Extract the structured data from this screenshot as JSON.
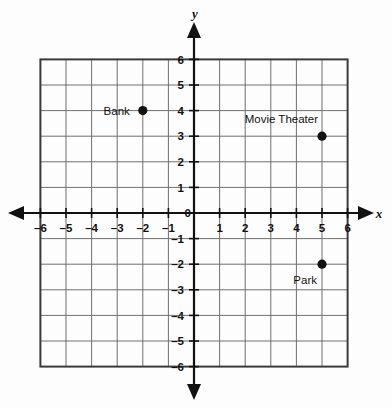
{
  "chart_data": {
    "type": "scatter",
    "title": "",
    "xlabel": "x",
    "ylabel": "y",
    "xlim": [
      -6,
      6
    ],
    "ylim": [
      -6,
      6
    ],
    "grid": true,
    "legend": "none",
    "x_ticks": [
      "-6",
      "-5",
      "-4",
      "-3",
      "-2",
      "-1",
      "1",
      "2",
      "3",
      "4",
      "5",
      "6"
    ],
    "y_ticks": [
      "6",
      "5",
      "4",
      "3",
      "2",
      "1",
      "-1",
      "-2",
      "-3",
      "-4",
      "-5",
      "-6"
    ],
    "origin_label": "0",
    "points": [
      {
        "label": "Bank",
        "x": -2,
        "y": 4,
        "label_position": "left"
      },
      {
        "label": "Movie Theater",
        "x": 5,
        "y": 3,
        "label_position": "above-left"
      },
      {
        "label": "Park",
        "x": 5,
        "y": -2,
        "label_position": "below-left"
      }
    ]
  },
  "axes": {
    "x_axis_name": "x",
    "y_axis_name": "y",
    "origin": "0"
  },
  "x_ticks": [
    {
      "value": -6,
      "label": "-6"
    },
    {
      "value": -5,
      "label": "-5"
    },
    {
      "value": -4,
      "label": "-4"
    },
    {
      "value": -3,
      "label": "-3"
    },
    {
      "value": -2,
      "label": "-2"
    },
    {
      "value": -1,
      "label": "-1"
    },
    {
      "value": 1,
      "label": "1"
    },
    {
      "value": 2,
      "label": "2"
    },
    {
      "value": 3,
      "label": "3"
    },
    {
      "value": 4,
      "label": "4"
    },
    {
      "value": 5,
      "label": "5"
    },
    {
      "value": 6,
      "label": "6"
    }
  ],
  "y_ticks": [
    {
      "value": 6,
      "label": "6"
    },
    {
      "value": 5,
      "label": "5"
    },
    {
      "value": 4,
      "label": "4"
    },
    {
      "value": 3,
      "label": "3"
    },
    {
      "value": 2,
      "label": "2"
    },
    {
      "value": 1,
      "label": "1"
    },
    {
      "value": -1,
      "label": "-1"
    },
    {
      "value": -2,
      "label": "-2"
    },
    {
      "value": -3,
      "label": "-3"
    },
    {
      "value": -4,
      "label": "-4"
    },
    {
      "value": -5,
      "label": "-5"
    },
    {
      "value": -6,
      "label": "-6"
    }
  ],
  "points": [
    {
      "name": "bank",
      "label": "Bank",
      "x": -2,
      "y": 4
    },
    {
      "name": "movie-theater",
      "label": "Movie Theater",
      "x": 5,
      "y": 3
    },
    {
      "name": "park",
      "label": "Park",
      "x": 5,
      "y": -2
    }
  ],
  "colors": {
    "background": "#fdfdfd",
    "grid_line": "#6f6f6f",
    "grid_border": "#3a3a3a",
    "axis": "#111111",
    "point_fill": "#111111",
    "text": "#111111"
  }
}
